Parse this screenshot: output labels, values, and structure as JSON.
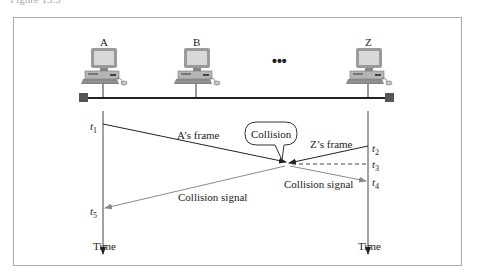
{
  "caption": "Figure 13.5",
  "stations": [
    {
      "label": "A"
    },
    {
      "label": "B"
    },
    {
      "label": "Z"
    }
  ],
  "ellipsis": "•••",
  "bubble": {
    "label": "Collision"
  },
  "frames": {
    "a_frame": "A’s frame",
    "z_frame": "Z’s frame",
    "collision_signal_left": "Collision signal",
    "collision_signal_right": "Collision signal"
  },
  "times": {
    "t1": {
      "base": "t",
      "sub": "1"
    },
    "t2": {
      "base": "t",
      "sub": "2"
    },
    "t3": {
      "base": "t",
      "sub": "3"
    },
    "t4": {
      "base": "t",
      "sub": "4"
    },
    "t5": {
      "base": "t",
      "sub": "5"
    }
  },
  "axes": {
    "left": "Time",
    "right": "Time"
  },
  "colors": {
    "line": "#222222",
    "signal": "#8a8a8a",
    "terminator": "#555555",
    "border": "#a8a8a8"
  }
}
